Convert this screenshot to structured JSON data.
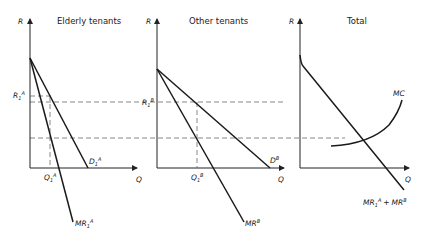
{
  "panels": [
    {
      "title": "Elderly tenants",
      "y_axis": "R",
      "x_axis": "Q",
      "price_label": "R",
      "price_sub": "1",
      "price_sup": "A",
      "quantity_label": "Q",
      "quantity_sub": "1",
      "quantity_sup": "A",
      "demand_label": "D",
      "demand_sub": "1",
      "demand_sup": "A",
      "mr_label": "MR",
      "mr_sub": "1",
      "mr_sup": "A"
    },
    {
      "title": "Other tenants",
      "y_axis": "R",
      "x_axis": "Q",
      "price_label": "R",
      "price_sub": "1",
      "price_sup": "B",
      "quantity_label": "Q",
      "quantity_sub": "1",
      "quantity_sup": "B",
      "demand_label": "D",
      "demand_sup": "B",
      "mr_label": "MR",
      "mr_sup": "B"
    },
    {
      "title": "Total",
      "y_axis": "R",
      "x_axis": "Q",
      "mc_label": "MC",
      "mr_label_a": "MR",
      "mr_sub_a": "1",
      "mr_sup_a": "A",
      "plus": "+",
      "mr_label_b": "MR",
      "mr_sup_b": "B"
    }
  ]
}
